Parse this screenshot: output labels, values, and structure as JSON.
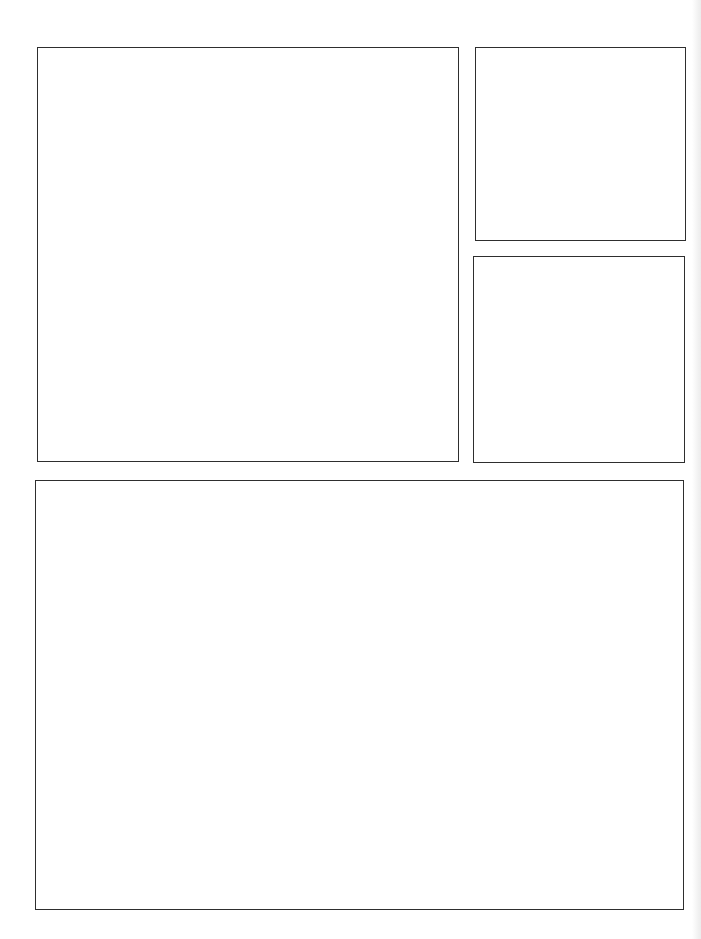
{
  "page": {
    "type": "blank comic page template",
    "background": "#ffffff",
    "border_color": "#2e2e2e"
  },
  "panels": [
    {
      "id": "panel-1",
      "label": "",
      "left": 37,
      "top": 47,
      "width": 422,
      "height": 415
    },
    {
      "id": "panel-2",
      "label": "",
      "left": 475,
      "top": 47,
      "width": 211,
      "height": 194
    },
    {
      "id": "panel-3",
      "label": "",
      "left": 473,
      "top": 256,
      "width": 212,
      "height": 207
    },
    {
      "id": "panel-4",
      "label": "",
      "left": 35,
      "top": 480,
      "width": 649,
      "height": 430
    }
  ]
}
